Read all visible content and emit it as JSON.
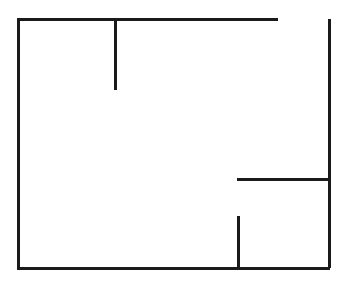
{
  "canvas": {
    "width": 348,
    "height": 286,
    "background_color": "#ffffff"
  },
  "diagram": {
    "kind": "floor-plan",
    "stroke_color": "#1a1a1a",
    "stroke_width": 3,
    "units": "px"
  },
  "walls": [
    {
      "name": "top-wall",
      "orientation": "horizontal",
      "x1": 17,
      "y1": 19,
      "x2": 278,
      "y2": 19,
      "length": 261,
      "note": "upper exterior wall, stops short of the right wall leaving a gap"
    },
    {
      "name": "left-wall",
      "orientation": "vertical",
      "x1": 18,
      "y1": 18,
      "x2": 18,
      "y2": 268,
      "length": 250,
      "note": "full-height exterior wall"
    },
    {
      "name": "bottom-wall",
      "orientation": "horizontal",
      "x1": 17,
      "y1": 268,
      "x2": 330,
      "y2": 268,
      "length": 313,
      "note": "lower exterior wall, spans full width"
    },
    {
      "name": "right-wall",
      "orientation": "vertical",
      "x1": 329,
      "y1": 19,
      "x2": 329,
      "y2": 268,
      "length": 249,
      "note": "full-height exterior wall"
    },
    {
      "name": "upper-partition-stub",
      "orientation": "vertical",
      "x1": 115,
      "y1": 19,
      "x2": 115,
      "y2": 90,
      "length": 71,
      "note": "interior partition hanging down from the top wall"
    },
    {
      "name": "right-partition-horizontal",
      "orientation": "horizontal",
      "x1": 237,
      "y1": 179,
      "x2": 330,
      "y2": 179,
      "length": 93,
      "note": "interior partition reaching the right wall"
    },
    {
      "name": "lower-partition-stub",
      "orientation": "vertical",
      "x1": 238,
      "y1": 216,
      "x2": 238,
      "y2": 268,
      "length": 52,
      "note": "interior partition rising from the bottom wall"
    }
  ],
  "openings": [
    {
      "name": "top-right-doorway",
      "orientation": "horizontal",
      "x1": 278,
      "y1": 19,
      "x2": 329,
      "y2": 19,
      "width": 51,
      "note": "gap between end of top wall and right wall"
    },
    {
      "name": "upper-partition-opening",
      "orientation": "vertical",
      "x1": 115,
      "y1": 90,
      "x2": 115,
      "y2": 268,
      "width": 178,
      "note": "open span below the upper partition stub"
    },
    {
      "name": "right-partition-opening",
      "orientation": "vertical",
      "x1": 238,
      "y1": 179,
      "x2": 238,
      "y2": 216,
      "width": 37,
      "note": "gap between horizontal partition and lower stub"
    }
  ]
}
